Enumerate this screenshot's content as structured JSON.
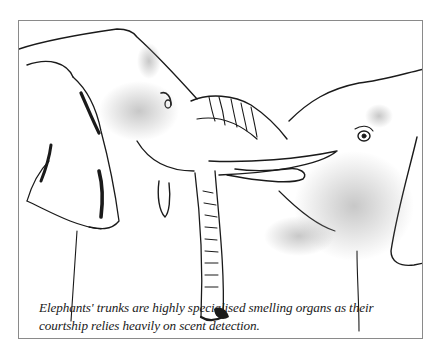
{
  "figure": {
    "caption": "Elephants' trunks are highly specialised smelling organs as their courtship relies heavily on scent detection.",
    "colors": {
      "ink": "#1a1a1a",
      "frame": "#8a8a8a",
      "paper": "#ffffff",
      "shading": "#b8b8b8"
    }
  }
}
